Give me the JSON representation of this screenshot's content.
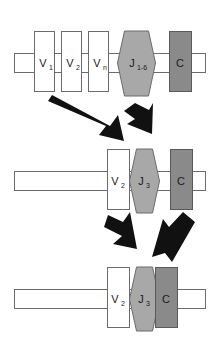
{
  "diagram": {
    "colors": {
      "background": "#ffffff",
      "v_segment_fill": "#ffffff",
      "v_segment_stroke": "#6b6b6b",
      "j_segment_fill": "#a8a8a8",
      "j_segment_stroke": "#6b6b6b",
      "c_segment_fill": "#8a8a8a",
      "c_segment_stroke": "#5a5a5a",
      "dna_bar_fill": "#ffffff",
      "dna_bar_stroke": "#6b6b6b",
      "arrow_fill": "#111111"
    },
    "rows": [
      {
        "name": "germline-row",
        "segments": [
          {
            "name": "v1",
            "type": "v",
            "label": "V",
            "subscript": "1"
          },
          {
            "name": "v2",
            "type": "v",
            "label": "V",
            "subscript": "2"
          },
          {
            "name": "vn",
            "type": "v",
            "label": "V",
            "subscript": "n"
          },
          {
            "name": "j16",
            "type": "j",
            "label": "J",
            "subscript": "1-6"
          },
          {
            "name": "c",
            "type": "c",
            "label": "C",
            "subscript": ""
          }
        ]
      },
      {
        "name": "intermediate-row",
        "segments": [
          {
            "name": "v2",
            "type": "v",
            "label": "V",
            "subscript": "2"
          },
          {
            "name": "j3",
            "type": "j",
            "label": "J",
            "subscript": "3"
          },
          {
            "name": "c",
            "type": "c",
            "label": "C",
            "subscript": ""
          }
        ]
      },
      {
        "name": "final-row",
        "segments": [
          {
            "name": "v2",
            "type": "v",
            "label": "V",
            "subscript": "2"
          },
          {
            "name": "j3",
            "type": "j",
            "label": "J",
            "subscript": "3"
          },
          {
            "name": "c",
            "type": "c",
            "label": "C",
            "subscript": ""
          }
        ]
      }
    ],
    "arrows": [
      {
        "name": "arrow-v-to-j-left",
        "group": "upper"
      },
      {
        "name": "arrow-j-down-right",
        "group": "upper"
      },
      {
        "name": "arrow-vj-down-left",
        "group": "lower"
      },
      {
        "name": "arrow-c-down-right",
        "group": "lower"
      }
    ]
  }
}
